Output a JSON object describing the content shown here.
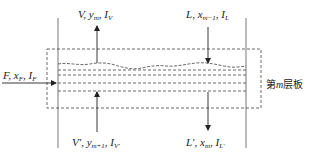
{
  "diagram": {
    "type": "tray stream schematic",
    "tray_label": {
      "prefix": "第",
      "var": "m",
      "suffix": "层板"
    },
    "streams": {
      "vapor_out": {
        "name": "V",
        "comp": "y",
        "comp_sub": "m",
        "enth": "I",
        "enth_sub": "V",
        "direction": "up"
      },
      "liquid_in": {
        "name": "L",
        "comp": "x",
        "comp_sub": "m−1",
        "enth": "I",
        "enth_sub": "L",
        "direction": "down"
      },
      "feed": {
        "name": "F",
        "comp": "x",
        "comp_sub": "F",
        "enth": "I",
        "enth_sub": "F",
        "direction": "right"
      },
      "vapor_in": {
        "name": "V′",
        "comp": "y",
        "comp_sub": "m+1",
        "enth": "I",
        "enth_sub": "V′",
        "direction": "up"
      },
      "liquid_out": {
        "name": "L′",
        "comp": "x",
        "comp_sub": "m",
        "enth": "I",
        "enth_sub": "L′",
        "direction": "down"
      }
    },
    "colors": {
      "line": "#333333",
      "background": "#ffffff"
    }
  }
}
